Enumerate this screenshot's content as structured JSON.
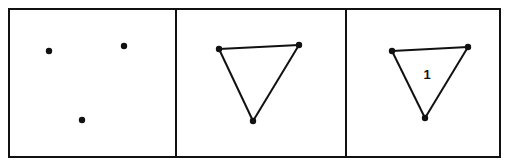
{
  "diagram": {
    "panels": [
      {
        "id": "panel-1",
        "x": 9,
        "y": 9,
        "w": 167,
        "h": 148,
        "points": [
          [
            49,
            51
          ],
          [
            124,
            46
          ],
          [
            82,
            120
          ]
        ],
        "edges": [],
        "label": null
      },
      {
        "id": "panel-2",
        "x": 176,
        "y": 9,
        "w": 170,
        "h": 148,
        "points": [
          [
            219,
            49
          ],
          [
            299,
            45
          ],
          [
            253,
            121
          ]
        ],
        "edges": [
          [
            0,
            1
          ],
          [
            1,
            2
          ],
          [
            2,
            0
          ]
        ],
        "label": null
      },
      {
        "id": "panel-3",
        "x": 346,
        "y": 9,
        "w": 154,
        "h": 148,
        "points": [
          [
            392,
            51
          ],
          [
            468,
            47
          ],
          [
            425,
            118
          ]
        ],
        "edges": [
          [
            0,
            1
          ],
          [
            1,
            2
          ],
          [
            2,
            0
          ]
        ],
        "label": {
          "text": "1",
          "x": 427,
          "y": 79
        }
      }
    ],
    "colors": {
      "stroke": "#111111",
      "background": "#ffffff"
    }
  }
}
